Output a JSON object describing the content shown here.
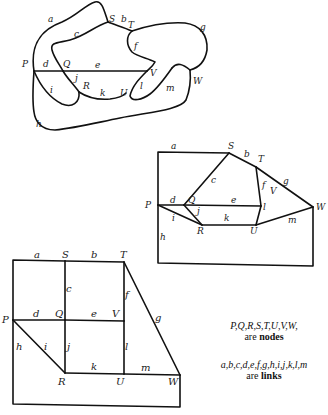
{
  "diagrams": [
    {
      "name": "curved-map",
      "node_labels": {
        "P": "P",
        "Q": "Q",
        "R": "R",
        "S": "S",
        "T": "T",
        "U": "U",
        "V": "V",
        "W": "W"
      },
      "link_labels": {
        "a": "a",
        "b": "b",
        "c": "c",
        "d": "d",
        "e": "e",
        "f": "f",
        "g": "g",
        "h": "h",
        "i": "i",
        "j": "j",
        "k": "k",
        "l": "l",
        "m": "m"
      }
    },
    {
      "name": "straightened-graph",
      "node_labels": {
        "P": "P",
        "Q": "Q",
        "R": "R",
        "S": "S",
        "T": "T",
        "U": "U",
        "V": "V",
        "W": "W"
      },
      "link_labels": {
        "a": "a",
        "b": "b",
        "c": "c",
        "d": "d",
        "e": "e",
        "f": "f",
        "g": "g",
        "h": "h",
        "i": "i",
        "j": "j",
        "k": "k",
        "l": "l",
        "m": "m"
      }
    },
    {
      "name": "grid-graph",
      "node_labels": {
        "P": "P",
        "Q": "Q",
        "R": "R",
        "S": "S",
        "T": "T",
        "U": "U",
        "V": "V",
        "W": "W"
      },
      "link_labels": {
        "a": "a",
        "b": "b",
        "c": "c",
        "d": "d",
        "e": "e",
        "f": "f",
        "g": "g",
        "h": "h",
        "i": "i",
        "j": "j",
        "k": "k",
        "l": "l",
        "m": "m"
      }
    }
  ],
  "legend": {
    "nodes_list": "P,Q,R,S,T,U,V,W,",
    "nodes_suffix": "are ",
    "nodes_word": "nodes",
    "links_list": "a,b,c,d,e,f,g,h,i,j,k,l,m",
    "links_suffix": "are ",
    "links_word": "links"
  }
}
